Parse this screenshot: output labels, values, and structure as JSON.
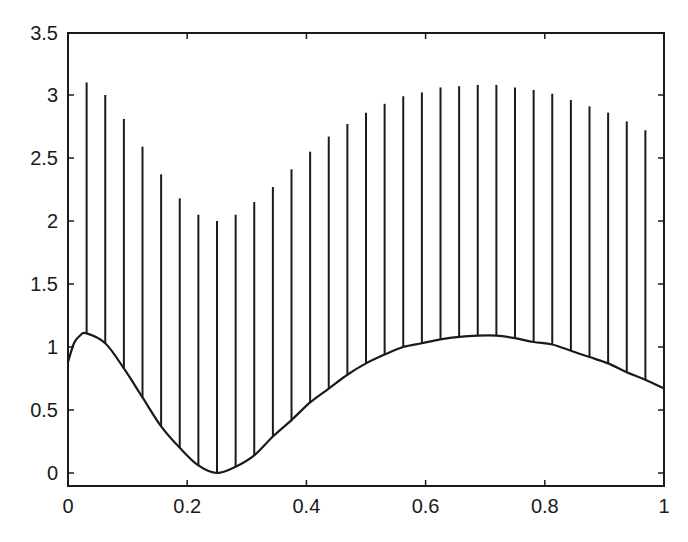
{
  "chart_data": {
    "type": "line",
    "title": "",
    "xlabel": "",
    "ylabel": "",
    "xlim": [
      0,
      1
    ],
    "ylim": [
      -0.1,
      3.5
    ],
    "grid": false,
    "legend": null,
    "xticks": [
      0,
      0.2,
      0.4,
      0.6,
      0.8,
      1
    ],
    "xtick_labels": [
      "0",
      "0.2",
      "0.4",
      "0.6",
      "0.8",
      "1"
    ],
    "yticks": [
      0,
      0.5,
      1,
      1.5,
      2,
      2.5,
      3,
      3.5
    ],
    "ytick_labels": [
      "0",
      "0.5",
      "1",
      "1.5",
      "2",
      "2.5",
      "3",
      "3.5"
    ],
    "series": [
      {
        "name": "curve",
        "style": "solid line",
        "x": [
          0,
          0.01,
          0.02,
          0.03,
          0.0625,
          0.09375,
          0.125,
          0.15625,
          0.1875,
          0.21875,
          0.25,
          0.28125,
          0.3125,
          0.34375,
          0.375,
          0.40625,
          0.4375,
          0.46875,
          0.5,
          0.53125,
          0.5625,
          0.59375,
          0.625,
          0.65625,
          0.6875,
          0.71875,
          0.75,
          0.78125,
          0.8125,
          0.84375,
          0.875,
          0.90625,
          0.9375,
          0.96875,
          1.0
        ],
        "y": [
          0.88,
          1.03,
          1.09,
          1.11,
          1.03,
          0.83,
          0.6,
          0.37,
          0.2,
          0.06,
          0.0,
          0.05,
          0.14,
          0.29,
          0.42,
          0.56,
          0.67,
          0.78,
          0.87,
          0.94,
          1.0,
          1.03,
          1.06,
          1.08,
          1.09,
          1.09,
          1.07,
          1.04,
          1.02,
          0.97,
          0.92,
          0.87,
          0.8,
          0.74,
          0.67
        ]
      },
      {
        "name": "vertical-stems",
        "style": "vertical segments from curve up to top",
        "x": [
          0.03125,
          0.0625,
          0.09375,
          0.125,
          0.15625,
          0.1875,
          0.21875,
          0.25,
          0.28125,
          0.3125,
          0.34375,
          0.375,
          0.40625,
          0.4375,
          0.46875,
          0.5,
          0.53125,
          0.5625,
          0.59375,
          0.625,
          0.65625,
          0.6875,
          0.71875,
          0.75,
          0.78125,
          0.8125,
          0.84375,
          0.875,
          0.90625,
          0.9375,
          0.96875
        ],
        "bottom": [
          1.11,
          1.03,
          0.83,
          0.6,
          0.37,
          0.2,
          0.06,
          0.0,
          0.05,
          0.14,
          0.29,
          0.42,
          0.56,
          0.67,
          0.78,
          0.87,
          0.94,
          1.0,
          1.03,
          1.06,
          1.08,
          1.09,
          1.09,
          1.07,
          1.04,
          1.02,
          0.97,
          0.92,
          0.87,
          0.8,
          0.74
        ],
        "top": [
          3.1,
          3.0,
          2.81,
          2.59,
          2.37,
          2.18,
          2.05,
          2.0,
          2.05,
          2.15,
          2.27,
          2.41,
          2.55,
          2.67,
          2.77,
          2.86,
          2.93,
          2.99,
          3.02,
          3.06,
          3.07,
          3.08,
          3.08,
          3.06,
          3.04,
          3.01,
          2.96,
          2.91,
          2.86,
          2.79,
          2.72
        ]
      }
    ]
  },
  "colors": {
    "ink": "#1a1a1a",
    "background": "#ffffff"
  }
}
